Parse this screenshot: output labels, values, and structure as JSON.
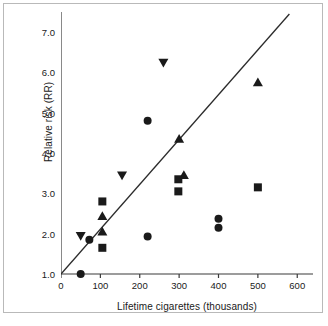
{
  "chart_data": {
    "type": "scatter",
    "title": "",
    "xlabel": "Lifetime cigarettes (thousands)",
    "ylabel": "Relative risk (RR)",
    "xlim": [
      0,
      640
    ],
    "ylim": [
      1.0,
      7.5
    ],
    "xticks": [
      0,
      100,
      200,
      300,
      400,
      500,
      600
    ],
    "xticklabels": [
      "0",
      "100",
      "200",
      "300",
      "400",
      "500",
      "600"
    ],
    "yticks": [
      1.0,
      2.0,
      3.0,
      4.0,
      5.0,
      6.0,
      7.0
    ],
    "yticklabels": [
      "1.0",
      "2.0",
      "3.0",
      "4.0",
      "5.0",
      "6.0",
      "7.0"
    ],
    "grid": false,
    "legend": "none",
    "marker_color": "#1a1a1a",
    "line_color": "#2b2b2b",
    "series": [
      {
        "name": "circle",
        "marker": "circle",
        "points": [
          {
            "x": 50,
            "y": 1.0
          },
          {
            "x": 72,
            "y": 1.85
          },
          {
            "x": 220,
            "y": 1.93
          },
          {
            "x": 220,
            "y": 4.8
          },
          {
            "x": 400,
            "y": 2.15
          },
          {
            "x": 400,
            "y": 2.37
          }
        ]
      },
      {
        "name": "square",
        "marker": "square",
        "points": [
          {
            "x": 105,
            "y": 1.65
          },
          {
            "x": 105,
            "y": 2.8
          },
          {
            "x": 298,
            "y": 3.05
          },
          {
            "x": 298,
            "y": 3.35
          },
          {
            "x": 500,
            "y": 3.15
          }
        ]
      },
      {
        "name": "triangle-up",
        "marker": "triangle-up",
        "points": [
          {
            "x": 105,
            "y": 2.05
          },
          {
            "x": 105,
            "y": 2.43
          },
          {
            "x": 300,
            "y": 4.35
          },
          {
            "x": 312,
            "y": 3.45
          },
          {
            "x": 500,
            "y": 5.75
          }
        ]
      },
      {
        "name": "triangle-down",
        "marker": "triangle-down",
        "points": [
          {
            "x": 50,
            "y": 1.95
          },
          {
            "x": 155,
            "y": 3.45
          },
          {
            "x": 260,
            "y": 6.25
          }
        ]
      }
    ],
    "trend_line": {
      "name": "regression-line",
      "x0": 0,
      "y0": 1.0,
      "x1": 580,
      "y1": 7.45
    }
  }
}
